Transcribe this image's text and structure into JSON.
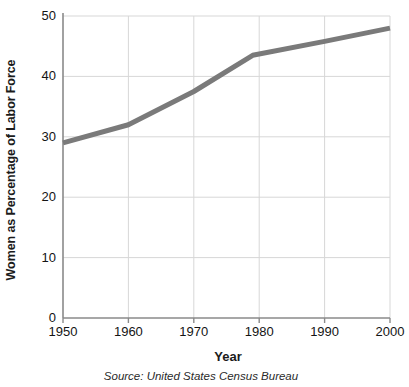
{
  "chart_data": {
    "type": "line",
    "title": "",
    "xlabel": "Year",
    "ylabel": "Women as Percentage of Labor Force",
    "source": "Source: United States Census Bureau",
    "x": [
      1950,
      1960,
      1970,
      1979,
      1990,
      2000
    ],
    "values": [
      29,
      32,
      37.5,
      43.5,
      45.8,
      48
    ],
    "series": [
      {
        "name": "Women as Percentage of Labor Force",
        "values": [
          29,
          32,
          37.5,
          43.5,
          45.8,
          48
        ]
      }
    ],
    "xticks": [
      1950,
      1960,
      1970,
      1980,
      1990,
      2000
    ],
    "xtick_labels": [
      "1950",
      "1960",
      "1970",
      "1980",
      "1990",
      "2000"
    ],
    "yticks": [
      0,
      10,
      20,
      30,
      40,
      50
    ],
    "ytick_labels": [
      "0",
      "10",
      "20",
      "30",
      "40",
      "50"
    ],
    "xlim": [
      1950,
      2000
    ],
    "ylim": [
      0,
      50
    ],
    "grid": true,
    "legend": "none",
    "line_color": "#7a7a7a",
    "grid_color": "#d7d7d7",
    "axis_color": "#8a8a8a",
    "text_color": "#141414",
    "background": "#ffffff",
    "line_width": 5
  }
}
